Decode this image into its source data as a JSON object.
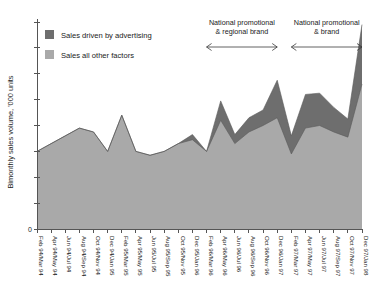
{
  "chart_data": {
    "type": "area",
    "stacked": true,
    "title": "",
    "subtitle": "",
    "xlabel": "",
    "ylabel": "Bimonthly sales volume, '000 units",
    "ylim": [
      0,
      800
    ],
    "y_tick_labels": [
      "0"
    ],
    "y_tick_count": 9,
    "grid": false,
    "legend_position": "top-left",
    "categories": [
      "Feb 94/Mar 94",
      "Apr 94/May 94",
      "Jun 94/Jul 94",
      "Aug 94/Sep 94",
      "Oct 94/Nov 94",
      "Dec 94/Jan 95",
      "Feb 95/Mar 95",
      "Apr 95/May 95",
      "Jun 95/Jul 95",
      "Aug 95/Sep 95",
      "Oct 95/Nov 95",
      "Dec 95/Jan 96",
      "Feb 96/Mar 96",
      "Apr 96/May 96",
      "Jun 96/Jul 96",
      "Aug 96/Sep 96",
      "Oct 96/Nov 96",
      "Dec 96/Jan 97",
      "Feb 97/Mar 97",
      "Apr 97/May 97",
      "Jun 97/Jul 97",
      "Aug 97/Sep 97",
      "Oct 97/Nov 97",
      "Dec 97/Jan 98"
    ],
    "series": [
      {
        "name": "Sales all other factors",
        "color": "#a9a9a9",
        "values": [
          300,
          330,
          360,
          390,
          375,
          300,
          440,
          300,
          285,
          300,
          330,
          345,
          300,
          420,
          330,
          375,
          400,
          430,
          290,
          390,
          400,
          375,
          355,
          560
        ]
      },
      {
        "name": "Sales driven by advertising",
        "color": "#6e6e6e",
        "values": [
          0,
          0,
          0,
          0,
          0,
          0,
          0,
          0,
          0,
          0,
          0,
          20,
          0,
          75,
          35,
          55,
          60,
          145,
          70,
          130,
          125,
          95,
          70,
          230
        ]
      }
    ],
    "annotations": [
      {
        "label_line1": "National promotional",
        "label_line2": "& regional brand",
        "start_category": "Feb 96/Mar 96",
        "end_category": "Dec 96/Jan 97",
        "arrow": "double"
      },
      {
        "label_line1": "National promotional",
        "label_line2": "& brand",
        "start_category": "Feb 97/Mar 97",
        "end_category": "Dec 97/Jan 98",
        "arrow": "double"
      }
    ]
  },
  "legend": {
    "items": [
      {
        "label": "Sales driven by advertising",
        "color": "#6e6e6e"
      },
      {
        "label": "Sales all other factors",
        "color": "#a9a9a9"
      }
    ]
  },
  "axis": {
    "y_title": "Bimonthly sales volume, '000 units",
    "zero_label": "0"
  }
}
